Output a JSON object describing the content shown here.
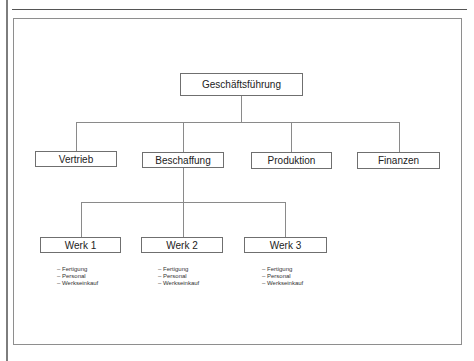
{
  "diagram": {
    "type": "org-chart",
    "root": {
      "label": "Geschäftsführung"
    },
    "departments": [
      {
        "label": "Vertrieb"
      },
      {
        "label": "Beschaffung"
      },
      {
        "label": "Produktion"
      },
      {
        "label": "Finanzen"
      }
    ],
    "plants": [
      {
        "label": "Werk 1",
        "functions": [
          "– Fertigung",
          "– Personal",
          "– Werkseinkauf"
        ]
      },
      {
        "label": "Werk 2",
        "functions": [
          "– Fertigung",
          "– Personal",
          "– Werkseinkauf"
        ]
      },
      {
        "label": "Werk 3",
        "functions": [
          "– Fertigung",
          "– Personal",
          "– Werkseinkauf"
        ]
      }
    ],
    "plants_parent": "Beschaffung",
    "colors": {
      "line": "#8a8a8a",
      "border": "#6f6f6f",
      "text": "#222222",
      "background": "#ffffff"
    }
  }
}
